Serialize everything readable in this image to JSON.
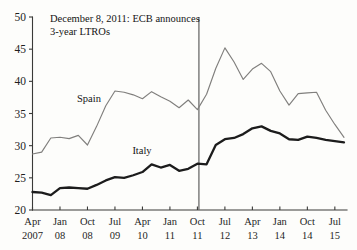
{
  "chart_data": {
    "type": "line",
    "title": "",
    "xlabel": "",
    "ylabel": "",
    "ylim": [
      20,
      50
    ],
    "yticks": [
      20,
      25,
      30,
      35,
      40,
      45,
      50
    ],
    "grid": false,
    "legend_position": "inline-labels",
    "xtick_labels": [
      {
        "month": "Apr",
        "year": "2007"
      },
      {
        "month": "Jan",
        "year": "08"
      },
      {
        "month": "Oct",
        "year": "08"
      },
      {
        "month": "Jul",
        "year": "09"
      },
      {
        "month": "Apr",
        "year": "10"
      },
      {
        "month": "Jan",
        "year": "11"
      },
      {
        "month": "Oct",
        "year": "11"
      },
      {
        "month": "Jul",
        "year": "12"
      },
      {
        "month": "Apr",
        "year": "13"
      },
      {
        "month": "Jan",
        "year": "14"
      },
      {
        "month": "Oct",
        "year": "14"
      },
      {
        "month": "Jul",
        "year": "15"
      }
    ],
    "x": [
      "2007-04",
      "2007-07",
      "2007-10",
      "2008-01",
      "2008-04",
      "2008-07",
      "2008-10",
      "2009-01",
      "2009-04",
      "2009-07",
      "2009-10",
      "2010-01",
      "2010-04",
      "2010-07",
      "2010-10",
      "2011-01",
      "2011-04",
      "2011-07",
      "2011-10",
      "2012-01",
      "2012-04",
      "2012-07",
      "2012-10",
      "2013-01",
      "2013-04",
      "2013-07",
      "2013-10",
      "2014-01",
      "2014-04",
      "2014-07",
      "2014-10",
      "2015-01",
      "2015-04",
      "2015-07",
      "2015-10"
    ],
    "series": [
      {
        "name": "Spain",
        "color": "#807f7d",
        "style": "thin-gray",
        "values": [
          28.7,
          29.0,
          31.2,
          31.3,
          31.1,
          31.6,
          30.1,
          33.0,
          36.2,
          38.5,
          38.3,
          37.9,
          37.3,
          38.4,
          37.6,
          36.9,
          35.9,
          37.1,
          35.6,
          38.0,
          42.0,
          45.2,
          43.0,
          40.3,
          41.9,
          42.8,
          41.5,
          38.5,
          36.3,
          38.1,
          38.2,
          38.3,
          35.5,
          33.3,
          31.3
        ]
      },
      {
        "name": "Italy",
        "color": "#1c1c1c",
        "style": "thick-black",
        "values": [
          22.8,
          22.7,
          22.3,
          23.4,
          23.5,
          23.4,
          23.3,
          23.9,
          24.6,
          25.1,
          25.0,
          25.4,
          25.9,
          27.1,
          26.6,
          27.0,
          26.1,
          26.4,
          27.2,
          27.1,
          30.1,
          31.0,
          31.2,
          31.8,
          32.7,
          33.0,
          32.3,
          31.9,
          31.0,
          30.9,
          31.4,
          31.2,
          30.9,
          30.7,
          30.5
        ]
      }
    ],
    "annotations": [
      {
        "id": "ecb-ltro-event",
        "line1": "December 8, 2011: ECB announces",
        "line2": "3-year LTROs",
        "event_x": "2011-11",
        "marker": "vertical-line"
      }
    ],
    "inline_labels": [
      {
        "name": "Spain",
        "text": "Spain"
      },
      {
        "name": "Italy",
        "text": "Italy"
      }
    ]
  }
}
